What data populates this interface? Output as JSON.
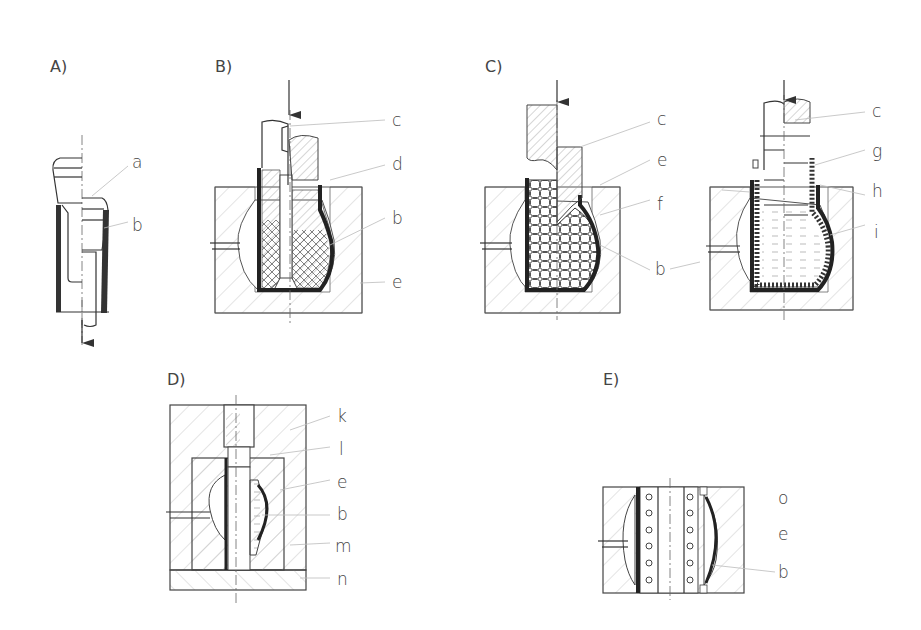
{
  "figure": {
    "panels": [
      {
        "id": "A",
        "label": "A)",
        "parts": [
          "a",
          "b"
        ],
        "arrow": "down"
      },
      {
        "id": "B",
        "label": "B)",
        "parts": [
          "c",
          "d",
          "b",
          "e"
        ],
        "arrow": "down"
      },
      {
        "id": "C1",
        "label": "C)",
        "parts": [
          "c",
          "e",
          "f",
          "b"
        ],
        "arrow": "down"
      },
      {
        "id": "C2",
        "label": "",
        "parts": [
          "c",
          "g",
          "h",
          "i"
        ],
        "arrow": "down"
      },
      {
        "id": "D",
        "label": "D)",
        "parts": [
          "k",
          "l",
          "e",
          "b",
          "m",
          "n"
        ]
      },
      {
        "id": "E",
        "label": "E)",
        "parts": [
          "o",
          "e",
          "b"
        ]
      }
    ]
  },
  "labels": {
    "A": "A)",
    "B": "B)",
    "C": "C)",
    "D": "D)",
    "E": "E)",
    "a": "a",
    "b": "b",
    "c": "c",
    "d": "d",
    "e": "e",
    "f": "f",
    "g": "g",
    "h": "h",
    "i": "i",
    "k": "k",
    "l": "l",
    "m": "m",
    "n": "n",
    "o": "o"
  }
}
